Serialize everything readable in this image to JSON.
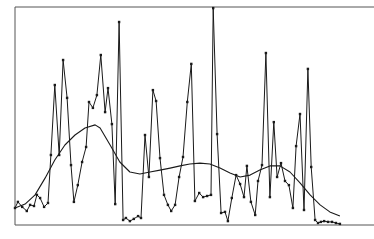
{
  "chart_data": {
    "type": "line",
    "title": "",
    "xlabel": "",
    "ylabel": "",
    "grid": false,
    "legend": null,
    "axes": {
      "show_ticks": false,
      "show_tick_labels": false,
      "frame": "top-right-bottom-left"
    },
    "ylim": [
      0,
      100
    ],
    "xlim": [
      0,
      100
    ],
    "series": [
      {
        "name": "raw",
        "style": "line-with-markers",
        "color": "#1a1a1a",
        "x": [
          0.0,
          0.8,
          2.0,
          3.3,
          4.2,
          5.3,
          6.1,
          7.0,
          8.1,
          9.2,
          10.0,
          11.1,
          12.3,
          13.4,
          14.5,
          15.6,
          16.4,
          17.5,
          18.7,
          19.8,
          20.6,
          21.7,
          22.8,
          23.9,
          25.1,
          25.9,
          27.0,
          27.9,
          29.0,
          30.1,
          30.9,
          32.0,
          33.1,
          34.3,
          35.1,
          36.2,
          37.3,
          38.4,
          39.3,
          40.4,
          41.5,
          42.6,
          43.5,
          44.6,
          45.7,
          46.8,
          48.0,
          49.1,
          50.1,
          51.3,
          52.4,
          53.5,
          54.6,
          55.2,
          56.3,
          57.4,
          58.5,
          59.3,
          60.4,
          61.6,
          62.7,
          63.8,
          64.6,
          65.7,
          66.9,
          67.7,
          68.8,
          69.9,
          71.0,
          72.1,
          73.0,
          74.1,
          75.2,
          76.3,
          77.4,
          78.3,
          79.4,
          80.5,
          81.6,
          82.5,
          83.6,
          84.4,
          85.2,
          86.1,
          87.2,
          88.3,
          89.4,
          90.5
        ],
        "y": [
          7.8,
          10.6,
          8.3,
          6.4,
          9.2,
          8.7,
          13.8,
          12.4,
          8.3,
          10.1,
          32.1,
          64.2,
          32.1,
          75.7,
          58.3,
          27.5,
          10.6,
          18.3,
          28.9,
          35.8,
          56.4,
          53.7,
          59.6,
          78.0,
          51.8,
          62.8,
          46.3,
          9.6,
          93.1,
          2.3,
          3.2,
          1.8,
          2.8,
          4.1,
          3.2,
          41.3,
          22.0,
          61.9,
          56.9,
          30.7,
          13.8,
          9.2,
          6.4,
          9.2,
          22.0,
          31.2,
          56.4,
          73.9,
          11.0,
          14.7,
          12.8,
          13.3,
          13.8,
          99.5,
          41.7,
          5.5,
          6.0,
          1.8,
          12.4,
          22.9,
          18.8,
          12.8,
          27.1,
          10.6,
          4.6,
          20.2,
          27.5,
          78.9,
          12.8,
          47.2,
          22.0,
          28.4,
          20.2,
          18.3,
          7.8,
          36.2,
          50.9,
          6.9,
          71.6,
          26.6,
          2.3,
          0.9,
          1.4,
          1.8,
          1.4,
          1.4,
          0.9,
          0.5
        ]
      },
      {
        "name": "smoothed",
        "style": "line",
        "color": "#1a1a1a",
        "x": [
          0.0,
          2.8,
          5.6,
          8.4,
          11.1,
          13.9,
          16.7,
          19.5,
          22.3,
          23.7,
          26.5,
          29.2,
          32.0,
          34.8,
          37.6,
          40.4,
          43.2,
          46.0,
          48.7,
          51.5,
          54.3,
          57.1,
          59.9,
          62.7,
          65.5,
          68.2,
          71.0,
          73.8,
          76.6,
          79.4,
          82.2,
          85.0,
          87.7,
          90.5
        ],
        "y": [
          7.8,
          9.6,
          13.8,
          21.6,
          29.8,
          36.7,
          41.3,
          44.5,
          45.9,
          44.5,
          36.7,
          28.9,
          24.3,
          23.4,
          24.3,
          25.2,
          26.1,
          27.1,
          28.0,
          28.4,
          28.0,
          26.1,
          23.9,
          22.0,
          22.9,
          25.2,
          27.1,
          27.1,
          24.3,
          19.3,
          13.8,
          9.2,
          6.0,
          4.1
        ]
      }
    ]
  },
  "plot_frame": {
    "left": 15,
    "top": 7,
    "right": 374,
    "bottom": 225
  },
  "colors": {
    "line": "#1a1a1a",
    "frame": "#555555",
    "background": "#ffffff"
  }
}
